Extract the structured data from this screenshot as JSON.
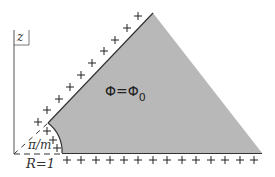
{
  "diagram": {
    "axis_label": "z",
    "region_label": {
      "lhs": "Φ",
      "eq": "=",
      "rhs": "Φ",
      "rhs_subscript": "0"
    },
    "angle_label": "π/m",
    "radius_label": "R=1",
    "colors": {
      "region_fill": "#b8b8b8",
      "line": "#333333",
      "plus": "#222222",
      "background": "#ffffff"
    },
    "charges": {
      "symbol": "+",
      "diagonal_count": 11,
      "arc_count": 3,
      "bottom_count": 15
    }
  }
}
